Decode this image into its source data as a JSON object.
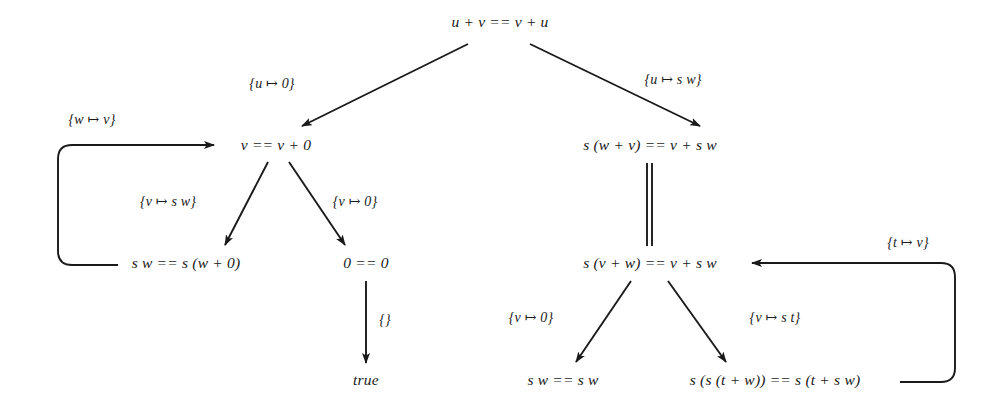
{
  "figure": {
    "kind": "narrowing-derivation-tree",
    "background_color": "#ffffff",
    "ink_color": "#1a1a1a",
    "width": 995,
    "height": 410
  },
  "nodes": [
    {
      "id": "root",
      "label": "u + v == v + u",
      "x": 500,
      "y": 22
    },
    {
      "id": "left1",
      "label": "v == v + 0",
      "x": 276,
      "y": 145
    },
    {
      "id": "right1",
      "label": "s (w + v) == v + s w",
      "x": 650,
      "y": 145
    },
    {
      "id": "left2a",
      "label": "s w == s (w + 0)",
      "x": 186,
      "y": 263
    },
    {
      "id": "left2b",
      "label": "0 == 0",
      "x": 366,
      "y": 263
    },
    {
      "id": "right2",
      "label": "s (v + w) == v + s w",
      "x": 650,
      "y": 263
    },
    {
      "id": "true-leaf",
      "label": "true",
      "x": 366,
      "y": 380
    },
    {
      "id": "right3a",
      "label": "s w == s w",
      "x": 563,
      "y": 380
    },
    {
      "id": "right3b",
      "label": "s (s (t + w)) == s (t + s w)",
      "x": 775,
      "y": 380
    }
  ],
  "edge_labels": [
    {
      "id": "lbl-u-0",
      "label": "{u ↦ 0}",
      "x": 272,
      "y": 84
    },
    {
      "id": "lbl-u-sw",
      "label": "{u ↦ s w}",
      "x": 673,
      "y": 80
    },
    {
      "id": "lbl-w-v",
      "label": "{w ↦ v}",
      "x": 92,
      "y": 120
    },
    {
      "id": "lbl-v-sw",
      "label": "{v ↦ s w}",
      "x": 168,
      "y": 202
    },
    {
      "id": "lbl-v-0a",
      "label": "{v ↦ 0}",
      "x": 355,
      "y": 202
    },
    {
      "id": "lbl-empty",
      "label": "{}",
      "x": 385,
      "y": 320
    },
    {
      "id": "lbl-v-0b",
      "label": "{v ↦ 0}",
      "x": 531,
      "y": 318
    },
    {
      "id": "lbl-v-st",
      "label": "{v ↦ s t}",
      "x": 775,
      "y": 318
    },
    {
      "id": "lbl-t-v",
      "label": "{t ↦ v}",
      "x": 908,
      "y": 243
    }
  ],
  "edges": [
    {
      "id": "edge-root-left",
      "from": "root",
      "to": "left1",
      "style": "arrow"
    },
    {
      "id": "edge-root-right",
      "from": "root",
      "to": "right1",
      "style": "arrow"
    },
    {
      "id": "edge-left1-left2a",
      "from": "left1",
      "to": "left2a",
      "style": "arrow"
    },
    {
      "id": "edge-left1-left2b",
      "from": "left1",
      "to": "left2b",
      "style": "arrow"
    },
    {
      "id": "edge-left2b-true",
      "from": "left2b",
      "to": "true-leaf",
      "style": "arrow"
    },
    {
      "id": "edge-right1-right2",
      "from": "right1",
      "to": "right2",
      "style": "double-line"
    },
    {
      "id": "edge-right2-right3a",
      "from": "right2",
      "to": "right3a",
      "style": "arrow"
    },
    {
      "id": "edge-right2-right3b",
      "from": "right2",
      "to": "right3b",
      "style": "arrow"
    },
    {
      "id": "edge-back-left",
      "from": "left2a",
      "to": "left1",
      "style": "curved-back-arrow"
    },
    {
      "id": "edge-back-right",
      "from": "right3b",
      "to": "right2",
      "style": "curved-back-arrow"
    }
  ]
}
